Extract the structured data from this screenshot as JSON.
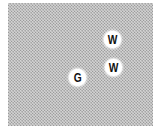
{
  "board": {
    "texture_colors": {
      "light": "#d4d4d4",
      "dark": "#9a9a9a"
    },
    "tokens": [
      {
        "label": "W",
        "x": 104,
        "y": 31
      },
      {
        "label": "W",
        "x": 105,
        "y": 59
      },
      {
        "label": "G",
        "x": 69,
        "y": 69
      }
    ]
  }
}
